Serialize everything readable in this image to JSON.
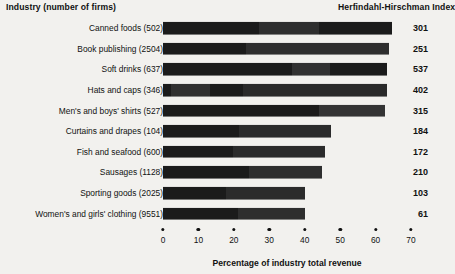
{
  "headers": {
    "industry": "Industry (number of firms)",
    "hhi": "Herfindahl-Hirschman Index"
  },
  "axis_title": "Percentage of industry total revenue",
  "chart_data": {
    "type": "bar",
    "orientation": "horizontal",
    "title": "",
    "xlabel": "Percentage of industry total revenue",
    "ylabel": "Industry (number of firms)",
    "xlim": [
      0,
      70
    ],
    "xticks": [
      0,
      10,
      20,
      30,
      40,
      50,
      60,
      70
    ],
    "xtick_labels": [
      "0",
      "10",
      "20",
      "30",
      "40",
      "50",
      "60",
      "70"
    ],
    "grid": false,
    "legend": "none",
    "value_column_header": "Herfindahl-Hirschman Index",
    "segment_colors": [
      "#1b1b1b",
      "#323232",
      "#1b1b1b",
      "#3b3b3b"
    ],
    "categories": [
      "Canned foods (502)",
      "Book publishing  (2504)",
      "Soft drinks (637)",
      "Hats and caps (346)",
      "Men's and boys' shirts (527)",
      "Curtains and drapes (104)",
      "Fish and seafood (600)",
      "Sausages (1128)",
      "Sporting goods (2025)",
      "Women's and girls' clothing (9551)"
    ],
    "values": [
      64.6,
      63.7,
      63.3,
      63.3,
      62.7,
      47.5,
      45.8,
      44.9,
      40.2,
      40.2
    ],
    "hhi": [
      301,
      251,
      537,
      402,
      315,
      184,
      172,
      210,
      103,
      61
    ],
    "rows": [
      {
        "label": "Canned foods (502)",
        "total": 64.6,
        "hhi": 301,
        "segments": [
          {
            "value": 27.2,
            "color": "#1b1b1b"
          },
          {
            "value": 16.8,
            "color": "#2e2e2e"
          },
          {
            "value": 20.6,
            "color": "#1b1b1b"
          }
        ]
      },
      {
        "label": "Book publishing  (2504)",
        "total": 63.7,
        "hhi": 251,
        "segments": [
          {
            "value": 23.3,
            "color": "#1b1b1b"
          },
          {
            "value": 40.4,
            "color": "#2e2e2e"
          }
        ]
      },
      {
        "label": "Soft drinks (637)",
        "total": 63.3,
        "hhi": 537,
        "segments": [
          {
            "value": 36.4,
            "color": "#1b1b1b"
          },
          {
            "value": 10.8,
            "color": "#313131"
          },
          {
            "value": 16.1,
            "color": "#1b1b1b"
          }
        ]
      },
      {
        "label": "Hats and caps (346)",
        "total": 63.3,
        "hhi": 402,
        "segments": [
          {
            "value": 2.2,
            "color": "#1b1b1b"
          },
          {
            "value": 11.1,
            "color": "#303030"
          },
          {
            "value": 9.3,
            "color": "#1b1b1b"
          },
          {
            "value": 40.7,
            "color": "#2a2a2a"
          }
        ]
      },
      {
        "label": "Men's and boys' shirts (527)",
        "total": 62.7,
        "hhi": 315,
        "segments": [
          {
            "value": 44.1,
            "color": "#1b1b1b"
          },
          {
            "value": 18.6,
            "color": "#343434"
          }
        ]
      },
      {
        "label": "Curtains and drapes (104)",
        "total": 47.5,
        "hhi": 184,
        "segments": [
          {
            "value": 21.5,
            "color": "#1b1b1b"
          },
          {
            "value": 26.0,
            "color": "#2b2b2b"
          }
        ]
      },
      {
        "label": "Fish and seafood (600)",
        "total": 45.8,
        "hhi": 172,
        "segments": [
          {
            "value": 19.8,
            "color": "#1b1b1b"
          },
          {
            "value": 26.0,
            "color": "#2b2b2b"
          }
        ]
      },
      {
        "label": "Sausages (1128)",
        "total": 44.9,
        "hhi": 210,
        "segments": [
          {
            "value": 24.3,
            "color": "#1b1b1b"
          },
          {
            "value": 20.6,
            "color": "#2e2e2e"
          }
        ]
      },
      {
        "label": "Sporting goods (2025)",
        "total": 40.2,
        "hhi": 103,
        "segments": [
          {
            "value": 17.8,
            "color": "#1b1b1b"
          },
          {
            "value": 22.4,
            "color": "#2b2b2b"
          }
        ]
      },
      {
        "label": "Women's and girls' clothing (9551)",
        "total": 40.2,
        "hhi": 61,
        "segments": [
          {
            "value": 21.2,
            "color": "#1b1b1b"
          },
          {
            "value": 19.0,
            "color": "#2e2e2e"
          }
        ]
      }
    ]
  }
}
